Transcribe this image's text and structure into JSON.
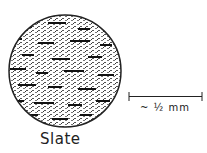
{
  "diagram": {
    "specimen": {
      "label": "Slate",
      "shape": "circle",
      "texture": "foliated fine-grained stippled rock thin section",
      "fill_color": "#ffffff",
      "stroke_color": "#222222"
    },
    "scale_bar": {
      "label": "~ ½ mm"
    }
  }
}
